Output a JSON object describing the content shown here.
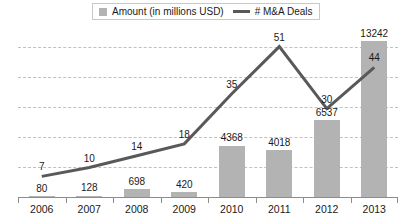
{
  "chart_data": {
    "type": "bar",
    "title": "",
    "subtitle": "",
    "xlabel": "",
    "ylabel": "",
    "categories": [
      "2006",
      "2007",
      "2008",
      "2009",
      "2010",
      "2011",
      "2012",
      "2013"
    ],
    "grid": true,
    "gridline_count": 5,
    "legend_position": "top",
    "series": [
      {
        "name": "Amount (in millions USD)",
        "type": "bar",
        "color": "#b3b3b3",
        "values": [
          80,
          128,
          698,
          420,
          4368,
          4018,
          6537,
          13242
        ],
        "labels": [
          "80",
          "128",
          "698",
          "420",
          "4368",
          "4018",
          "6537",
          "13242"
        ],
        "axis": "left",
        "ylim": [
          0,
          14500
        ]
      },
      {
        "name": "# M&A Deals",
        "type": "line",
        "color": "#595959",
        "values": [
          7,
          10,
          14,
          18,
          35,
          51,
          30,
          44
        ],
        "labels": [
          "7",
          "10",
          "14",
          "18",
          "35",
          "51",
          "30",
          "44"
        ],
        "axis": "right",
        "ylim": [
          0,
          58
        ]
      }
    ]
  },
  "legend": {
    "items": [
      {
        "label": "Amount (in millions USD)",
        "marker": "square-swatch",
        "color": "#b3b3b3"
      },
      {
        "label": "# M&A Deals",
        "marker": "line-swatch",
        "color": "#595959"
      }
    ]
  },
  "colors": {
    "bar": "#b3b3b3",
    "line": "#595959",
    "grid": "#c0c0c0",
    "axis": "#8c8c8c",
    "text": "#1a1a1a",
    "background": "#ffffff"
  }
}
